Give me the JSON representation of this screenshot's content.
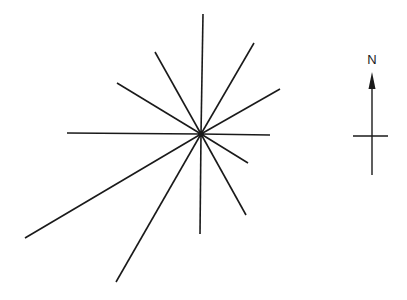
{
  "diagram": {
    "type": "rose-diagram",
    "background": "#ffffff",
    "stroke_color": "#1a1a1a",
    "center": {
      "x": 201,
      "y": 134
    },
    "rays": [
      {
        "name": "N",
        "x": 203,
        "y": 14
      },
      {
        "name": "NNE",
        "x": 254,
        "y": 43
      },
      {
        "name": "ENE",
        "x": 280,
        "y": 89
      },
      {
        "name": "E",
        "x": 270,
        "y": 135
      },
      {
        "name": "ESE",
        "x": 248,
        "y": 163
      },
      {
        "name": "SSE",
        "x": 246,
        "y": 215
      },
      {
        "name": "S",
        "x": 200,
        "y": 234
      },
      {
        "name": "SSW",
        "x": 116,
        "y": 282
      },
      {
        "name": "SW",
        "x": 25,
        "y": 238
      },
      {
        "name": "W",
        "x": 67,
        "y": 133
      },
      {
        "name": "WNW",
        "x": 117,
        "y": 83
      },
      {
        "name": "NNW",
        "x": 155,
        "y": 52
      }
    ],
    "north_arrow": {
      "label": "N",
      "x": 372,
      "label_y": 64,
      "tip_y": 72,
      "head_base_y": 89,
      "bottom_y": 175,
      "crossbar": {
        "x1": 353,
        "x2": 388,
        "y": 136
      }
    }
  }
}
